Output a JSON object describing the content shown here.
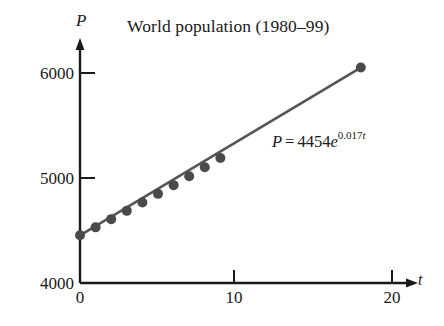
{
  "chart_data": {
    "type": "scatter",
    "title": "World population (1980–99)",
    "xlabel": "t",
    "ylabel": "P",
    "xlim": [
      0,
      21.5
    ],
    "ylim": [
      4000,
      6300
    ],
    "grid": false,
    "legend": "none",
    "annotations": [
      {
        "name": "model-equation",
        "text": "P = 4454e^{0.017t}",
        "lhs": "P",
        "equals": "=",
        "coefficient": "4454",
        "base": "e",
        "exponent": "0.017t"
      }
    ],
    "xticks": [
      0,
      10,
      20
    ],
    "xtick_labels": [
      "0",
      "10",
      "20"
    ],
    "yticks": [
      4000,
      5000,
      6000
    ],
    "ytick_labels": [
      "4000",
      "5000",
      "6000"
    ],
    "series": [
      {
        "name": "World population data",
        "marker": "filled-circle",
        "color": "#4a4a4a",
        "x": [
          0,
          1,
          2,
          3,
          4,
          5,
          6,
          7,
          8,
          9,
          18
        ],
        "y": [
          4454,
          4530,
          4608,
          4687,
          4767,
          4849,
          4932,
          5016,
          5102,
          5190,
          6052
        ]
      },
      {
        "name": "Exponential model curve",
        "marker": "none",
        "line": "solid",
        "color": "#555555",
        "x": [
          0,
          18
        ],
        "y": [
          4454,
          6052
        ]
      }
    ]
  },
  "figure": {
    "title": "World population (1980–99)",
    "y_axis_label": "P",
    "x_axis_label": "t",
    "ytick_6000": "6000",
    "ytick_5000": "5000",
    "ytick_4000": "4000",
    "xtick_0": "0",
    "xtick_10": "10",
    "xtick_20": "20",
    "equation": {
      "lhs": "P",
      "equals": "=",
      "coefficient": "4454",
      "base": "e",
      "exponent_value": "0.017",
      "exponent_var": "t"
    },
    "colors": {
      "axis": "#1a1a1a",
      "marker": "#4a4a4a",
      "curve": "#555555",
      "text": "#1a1a1a",
      "background": "#ffffff"
    }
  }
}
